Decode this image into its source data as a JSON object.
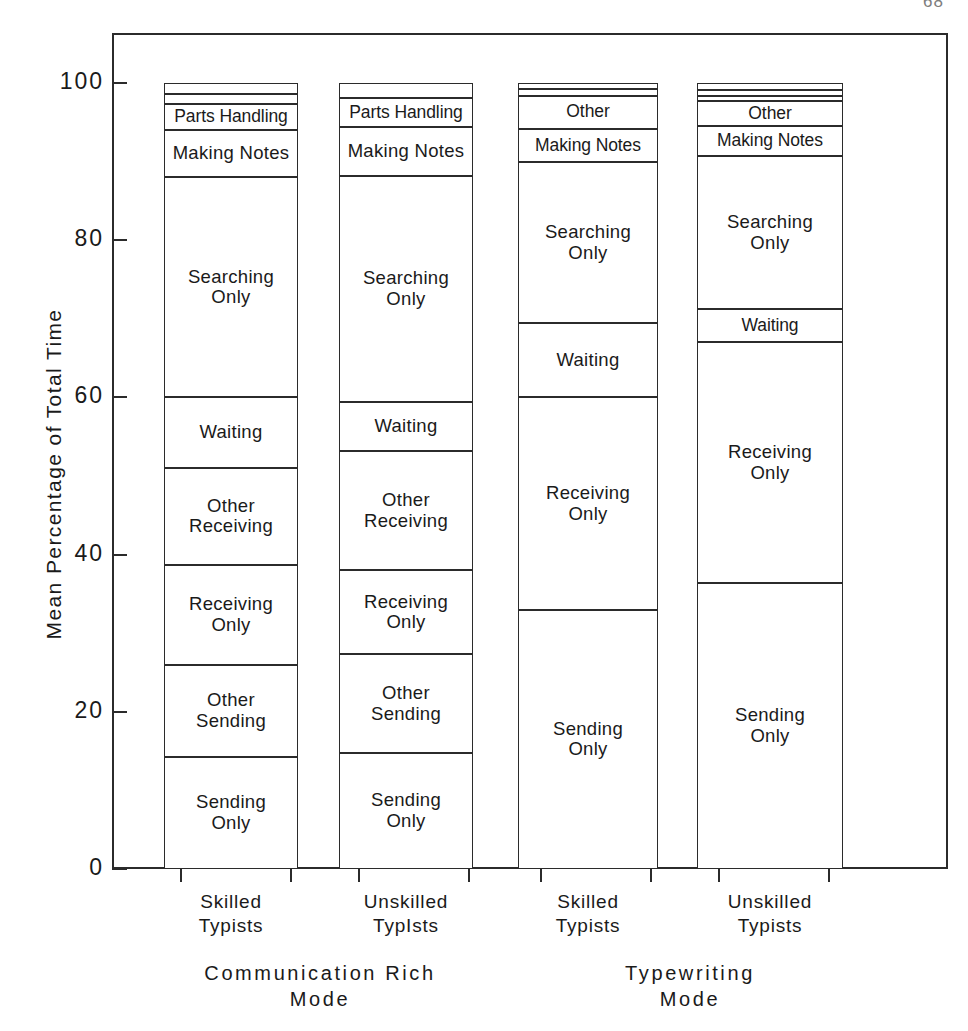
{
  "page": {
    "number": "68"
  },
  "chart_data": {
    "type": "bar",
    "subtype": "stacked-bar-100-percent",
    "title": "",
    "xlabel": "",
    "ylabel": "Mean Percentage of Total Time",
    "ylim": [
      0,
      100
    ],
    "y_ticks": [
      0,
      20,
      40,
      60,
      80,
      100
    ],
    "y_tick_labels": [
      "0",
      "20",
      "40",
      "60",
      "80",
      "100"
    ],
    "grid": false,
    "legend": "none (segments labeled in place)",
    "groups": [
      {
        "name": "Communication Rich\nMode",
        "categories": [
          "Skilled\nTypists",
          "Unskilled\nTypIsts"
        ]
      },
      {
        "name": "Typewriting\nMode",
        "categories": [
          "Skilled\nTypists",
          "Unskilled\nTypists"
        ]
      }
    ],
    "categories": [
      "Skilled Typists (Communication Rich Mode)",
      "Unskilled Typists (Communication Rich Mode)",
      "Skilled Typists (Typewriting Mode)",
      "Unskilled Typists (Typewriting Mode)"
    ],
    "bars": [
      {
        "id": "comm-rich-skilled",
        "category_label": "Skilled\nTypists",
        "group": "Communication Rich\nMode",
        "segments": [
          {
            "label": "",
            "value": 1.4,
            "cumulative_top": 100.0,
            "cumulative_bottom": 98.6,
            "labeled": false
          },
          {
            "label": "",
            "value": 1.3,
            "cumulative_top": 98.6,
            "cumulative_bottom": 97.3,
            "labeled": false
          },
          {
            "label": "Parts Handling",
            "value": 3.3,
            "cumulative_top": 97.3,
            "cumulative_bottom": 94.0,
            "labeled": true
          },
          {
            "label": "Making Notes",
            "value": 6.0,
            "cumulative_top": 94.0,
            "cumulative_bottom": 88.0,
            "labeled": true
          },
          {
            "label": "Searching\nOnly",
            "value": 28.0,
            "cumulative_top": 88.0,
            "cumulative_bottom": 60.0,
            "labeled": true
          },
          {
            "label": "Waiting",
            "value": 9.0,
            "cumulative_top": 60.0,
            "cumulative_bottom": 51.0,
            "labeled": true
          },
          {
            "label": "Other\nReceiving",
            "value": 12.3,
            "cumulative_top": 51.0,
            "cumulative_bottom": 38.7,
            "labeled": true
          },
          {
            "label": "Receiving\nOnly",
            "value": 12.7,
            "cumulative_top": 38.7,
            "cumulative_bottom": 26.0,
            "labeled": true
          },
          {
            "label": "Other\nSending",
            "value": 11.7,
            "cumulative_top": 26.0,
            "cumulative_bottom": 14.3,
            "labeled": true
          },
          {
            "label": "Sending\nOnly",
            "value": 14.3,
            "cumulative_top": 14.3,
            "cumulative_bottom": 0.0,
            "labeled": true
          }
        ]
      },
      {
        "id": "comm-rich-unskilled",
        "category_label": "Unskilled\nTypIsts",
        "group": "Communication Rich\nMode",
        "segments": [
          {
            "label": "",
            "value": 1.9,
            "cumulative_top": 100.0,
            "cumulative_bottom": 98.1,
            "labeled": false
          },
          {
            "label": "Parts Handling",
            "value": 3.7,
            "cumulative_top": 98.1,
            "cumulative_bottom": 94.4,
            "labeled": true
          },
          {
            "label": "Making Notes",
            "value": 6.2,
            "cumulative_top": 94.4,
            "cumulative_bottom": 88.2,
            "labeled": true
          },
          {
            "label": "Searching\nOnly",
            "value": 28.8,
            "cumulative_top": 88.2,
            "cumulative_bottom": 59.4,
            "labeled": true
          },
          {
            "label": "Waiting",
            "value": 6.2,
            "cumulative_top": 59.4,
            "cumulative_bottom": 53.2,
            "labeled": true
          },
          {
            "label": "Other\nReceiving",
            "value": 15.2,
            "cumulative_top": 53.2,
            "cumulative_bottom": 38.0,
            "labeled": true
          },
          {
            "label": "Receiving\nOnly",
            "value": 10.7,
            "cumulative_top": 38.0,
            "cumulative_bottom": 27.3,
            "labeled": true
          },
          {
            "label": "Other\nSending",
            "value": 12.5,
            "cumulative_top": 27.3,
            "cumulative_bottom": 14.8,
            "labeled": true
          },
          {
            "label": "Sending\nOnly",
            "value": 14.8,
            "cumulative_top": 14.8,
            "cumulative_bottom": 0.0,
            "labeled": true
          }
        ]
      },
      {
        "id": "typewriting-skilled",
        "category_label": "Skilled\nTypists",
        "group": "Typewriting\nMode",
        "segments": [
          {
            "label": "",
            "value": 0.8,
            "cumulative_top": 100.0,
            "cumulative_bottom": 99.2,
            "labeled": false
          },
          {
            "label": "",
            "value": 0.8,
            "cumulative_top": 99.2,
            "cumulative_bottom": 98.4,
            "labeled": false
          },
          {
            "label": "Other",
            "value": 4.2,
            "cumulative_top": 98.4,
            "cumulative_bottom": 94.2,
            "labeled": true
          },
          {
            "label": "Making Notes",
            "value": 4.3,
            "cumulative_top": 94.2,
            "cumulative_bottom": 89.9,
            "labeled": true
          },
          {
            "label": "Searching\nOnly",
            "value": 20.4,
            "cumulative_top": 89.9,
            "cumulative_bottom": 69.5,
            "labeled": true
          },
          {
            "label": "Waiting",
            "value": 9.5,
            "cumulative_top": 69.5,
            "cumulative_bottom": 60.0,
            "labeled": true
          },
          {
            "label": "Receiving\nOnly",
            "value": 27.0,
            "cumulative_top": 60.0,
            "cumulative_bottom": 33.0,
            "labeled": true
          },
          {
            "label": "Sending\nOnly",
            "value": 33.0,
            "cumulative_top": 33.0,
            "cumulative_bottom": 0.0,
            "labeled": true
          }
        ]
      },
      {
        "id": "typewriting-unskilled",
        "category_label": "Unskilled\nTypists",
        "group": "Typewriting\nMode",
        "segments": [
          {
            "label": "",
            "value": 0.9,
            "cumulative_top": 100.0,
            "cumulative_bottom": 99.1,
            "labeled": false
          },
          {
            "label": "",
            "value": 0.7,
            "cumulative_top": 99.1,
            "cumulative_bottom": 98.4,
            "labeled": false
          },
          {
            "label": "",
            "value": 0.7,
            "cumulative_top": 98.4,
            "cumulative_bottom": 97.7,
            "labeled": false
          },
          {
            "label": "Other",
            "value": 3.2,
            "cumulative_top": 97.7,
            "cumulative_bottom": 94.5,
            "labeled": true
          },
          {
            "label": "Making Notes",
            "value": 3.8,
            "cumulative_top": 94.5,
            "cumulative_bottom": 90.7,
            "labeled": true
          },
          {
            "label": "Searching\nOnly",
            "value": 19.5,
            "cumulative_top": 90.7,
            "cumulative_bottom": 71.2,
            "labeled": true
          },
          {
            "label": "Waiting",
            "value": 4.2,
            "cumulative_top": 71.2,
            "cumulative_bottom": 67.0,
            "labeled": true
          },
          {
            "label": "Receiving\nOnly",
            "value": 30.6,
            "cumulative_top": 67.0,
            "cumulative_bottom": 36.4,
            "labeled": true
          },
          {
            "label": "Sending\nOnly",
            "value": 36.4,
            "cumulative_top": 36.4,
            "cumulative_bottom": 0.0,
            "labeled": true
          }
        ]
      }
    ]
  }
}
